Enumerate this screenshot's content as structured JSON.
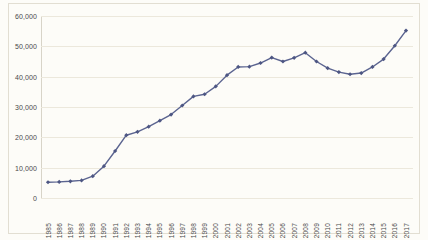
{
  "chart_data": {
    "type": "line",
    "title": "",
    "subtitle": "",
    "xlabel": "",
    "ylabel": "",
    "legend": [],
    "legend_position": "none",
    "grid": true,
    "grid_axis": "y",
    "ylim": [
      0,
      60000
    ],
    "yticks": [
      0,
      10000,
      20000,
      30000,
      40000,
      50000,
      60000
    ],
    "ytick_labels": [
      "0",
      "10,000",
      "20,000",
      "30,000",
      "40,000",
      "50,000",
      "60,000"
    ],
    "categories": [
      "1985",
      "1986",
      "1987",
      "1988",
      "1989",
      "1990",
      "1991",
      "1992",
      "1993",
      "1994",
      "1995",
      "1996",
      "1997",
      "1998",
      "1999",
      "2000",
      "2001",
      "2002",
      "2003",
      "2004",
      "2005",
      "2006",
      "2007",
      "2008",
      "2009",
      "2010",
      "2011",
      "2012",
      "2013",
      "2014",
      "2015",
      "2016",
      "2017"
    ],
    "values": [
      5200,
      5300,
      5500,
      5800,
      7200,
      10500,
      15500,
      20700,
      21800,
      23500,
      25500,
      27500,
      30500,
      33500,
      34200,
      36800,
      40500,
      43200,
      43300,
      44500,
      46300,
      45000,
      46200,
      47900,
      45000,
      42800,
      41500,
      40800,
      41200,
      43200,
      45800,
      50200,
      55200
    ],
    "marker": "diamond",
    "line_color": "#5b6490",
    "marker_color": "#4d5683",
    "gridline_color": "#ece8dc",
    "background_color": "#fdfcf8",
    "border_color": "#e2ded2",
    "tick_text_color": "#4a4a4a"
  }
}
